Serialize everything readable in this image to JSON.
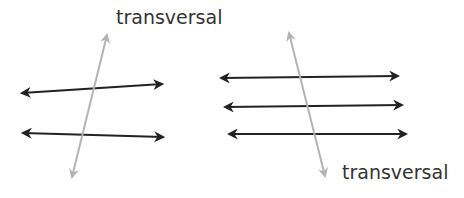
{
  "diagram": {
    "left": {
      "label": "transversal",
      "parallel_lines": 2,
      "transversal_color": "#b3b3b3",
      "line_color": "#222222"
    },
    "right": {
      "label": "transversal",
      "parallel_lines": 3,
      "transversal_color": "#b3b3b3",
      "line_color": "#222222"
    }
  }
}
